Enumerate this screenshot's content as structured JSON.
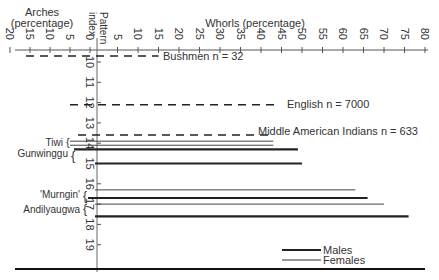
{
  "chart_data": {
    "type": "bar",
    "orientation": "horizontal",
    "title": "",
    "axes": {
      "arches": {
        "label_line1": "Arches",
        "label_line2": "(percentage)",
        "ticks": [
          20,
          15,
          10,
          5,
          0
        ],
        "range": [
          20,
          0
        ]
      },
      "whorls": {
        "label": "Whorls (percentage)",
        "ticks": [
          5,
          10,
          15,
          20,
          25,
          30,
          35,
          40,
          45,
          50,
          55,
          60,
          65,
          70,
          75,
          80
        ],
        "range": [
          0,
          80
        ]
      },
      "pattern_index": {
        "label_line1": "Pattern",
        "label_line2": "index",
        "ticks": [
          10,
          11,
          12,
          13,
          14,
          15,
          16,
          17,
          18,
          19
        ],
        "range": [
          9.5,
          20
        ]
      }
    },
    "series": [
      {
        "name": "Bushmen",
        "n_label": "n = 32",
        "sex": "combined",
        "style": "dashed",
        "pattern_index": 9.7,
        "arches": 16,
        "whorls": 15
      },
      {
        "name": "English",
        "n_label": "n = 7000",
        "sex": "combined",
        "style": "dashed",
        "pattern_index": 12.1,
        "arches": 5,
        "whorls": 44
      },
      {
        "name": "Middle American Indians",
        "n_label": "n = 633",
        "sex": "combined",
        "style": "dashed",
        "pattern_index": 13.6,
        "arches": 3,
        "whorls": 43
      },
      {
        "name": "Tiwi",
        "sex": "female",
        "style": "thin",
        "pattern_index": 13.9,
        "arches": 5,
        "whorls": 43
      },
      {
        "name": "Tiwi",
        "sex": "male",
        "style": "thin",
        "pattern_index": 14.1,
        "arches": 5,
        "whorls": 43
      },
      {
        "name": "Gunwinggu",
        "sex": "male",
        "style": "thick",
        "pattern_index": 14.3,
        "arches": 4,
        "whorls": 49
      },
      {
        "name": "Gunwinggu",
        "sex": "male",
        "style": "thick",
        "pattern_index": 15.0,
        "arches": 0,
        "whorls": 50
      },
      {
        "name": "'Murngin'",
        "sex": "female",
        "style": "thin",
        "pattern_index": 16.3,
        "arches": 0,
        "whorls": 63
      },
      {
        "name": "'Murngin'",
        "sex": "male",
        "style": "thick",
        "pattern_index": 16.7,
        "arches": 0.5,
        "whorls": 66
      },
      {
        "name": "Andilyaugwa",
        "sex": "female",
        "style": "thin",
        "pattern_index": 17.0,
        "arches": 0,
        "whorls": 70
      },
      {
        "name": "Andilyaugwa",
        "sex": "male",
        "style": "thick",
        "pattern_index": 17.6,
        "arches": 0,
        "whorls": 76
      }
    ],
    "legend": [
      {
        "label": "Males",
        "style": "thick"
      },
      {
        "label": "Females",
        "style": "thin"
      }
    ],
    "legend_position": "lower-right",
    "grid": false
  },
  "labels": {
    "arches_title1": "Arches",
    "arches_title2": "(percentage)",
    "whorls_title": "Whorls (percentage)",
    "pattern_title1": "Pattern",
    "pattern_title2": "index",
    "bushmen": "Bushmen n = 32",
    "english": "English n = 7000",
    "mai": "Middle American Indians n = 633",
    "tiwi": "Tiwi",
    "gunwinggu": "Gunwinggu",
    "murngin": "'Murngin'",
    "andilyaugwa": "Andilyaugwa",
    "legend_males": "Males",
    "legend_females": "Females"
  }
}
